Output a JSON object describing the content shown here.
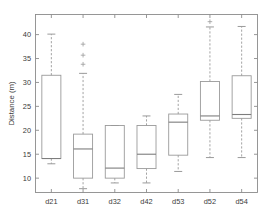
{
  "chart_data": {
    "type": "box",
    "title": "",
    "xlabel": "",
    "ylabel": "Distance (m)",
    "ylim": [
      7.0,
      44.2
    ],
    "yticks": [
      10,
      15,
      20,
      25,
      30,
      35,
      40
    ],
    "ytick_labels": [
      "10",
      "15",
      "20",
      "25",
      "30",
      "35",
      "40"
    ],
    "categories": [
      "d21",
      "d31",
      "d32",
      "d42",
      "d53",
      "d52",
      "d54"
    ],
    "grid": false,
    "legend": null,
    "box_style": "matlab-boxplot",
    "boxes": [
      {
        "label": "d21",
        "whisker_low": 13.0,
        "q1": 14.1,
        "median": 14.1,
        "q3": 31.5,
        "whisker_high": 40.1,
        "outliers": []
      },
      {
        "label": "d31",
        "whisker_low": 7.8,
        "q1": 10.0,
        "median": 16.1,
        "q3": 19.2,
        "whisker_high": 31.9,
        "outliers": [
          33.8,
          35.7,
          38.0
        ]
      },
      {
        "label": "d32",
        "whisker_low": 9.0,
        "q1": 10.0,
        "median": 12.1,
        "q3": 21.0,
        "whisker_high": 21.0,
        "outliers": []
      },
      {
        "label": "d42",
        "whisker_low": 9.0,
        "q1": 12.0,
        "median": 15.0,
        "q3": 21.0,
        "whisker_high": 23.0,
        "outliers": []
      },
      {
        "label": "d53",
        "whisker_low": 11.4,
        "q1": 14.8,
        "median": 21.7,
        "q3": 23.4,
        "whisker_high": 27.5,
        "outliers": []
      },
      {
        "label": "d52",
        "whisker_low": 14.3,
        "q1": 22.1,
        "median": 23.0,
        "q3": 30.2,
        "whisker_high": 41.6,
        "outliers": [
          42.7
        ]
      },
      {
        "label": "d54",
        "whisker_low": 14.3,
        "q1": 22.5,
        "median": 23.3,
        "q3": 31.4,
        "whisker_high": 41.7,
        "outliers": []
      }
    ],
    "colors": {
      "axis": "#8c8c8c",
      "box_edge": "#9a9a9a",
      "median": "#7d7d7d",
      "whisker": "#9a9a9a",
      "outlier": "#9a9a9a",
      "text": "#3a3a3a",
      "background": "#ffffff"
    }
  }
}
